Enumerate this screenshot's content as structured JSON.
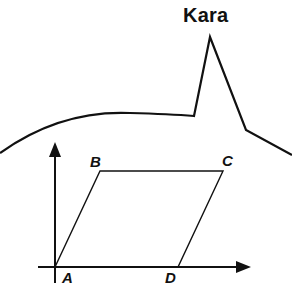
{
  "title": "Kara",
  "colors": {
    "background": "#ffffff",
    "stroke": "#111111"
  },
  "figure": {
    "outline_description": "Curved horizon line with a sharp peak labeled Kara",
    "peak_label": "Kara"
  },
  "parallelogram": {
    "vertices": [
      {
        "label": "A",
        "x": 55,
        "y": 267
      },
      {
        "label": "B",
        "x": 100,
        "y": 171
      },
      {
        "label": "C",
        "x": 223,
        "y": 171
      },
      {
        "label": "D",
        "x": 178,
        "y": 267
      }
    ]
  },
  "axes": {
    "x_axis": "horizontal arrow through A",
    "y_axis": "vertical arrow through A"
  },
  "labels": {
    "A": "A",
    "B": "B",
    "C": "C",
    "D": "D"
  }
}
